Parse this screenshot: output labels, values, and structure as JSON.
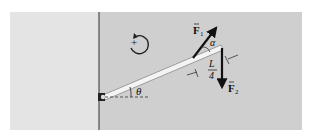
{
  "diagram": {
    "type": "physics-free-body",
    "colors": {
      "frame": "#ffffff",
      "wall_region": "#e4e4e4",
      "space_region": "#cfcfcf",
      "rod_fill": "#f4f4f4",
      "rod_edge": "#8a8a8a",
      "force_arrow": "#111111",
      "wall_line": "#333333"
    },
    "labels": {
      "force_1": "F",
      "force_1_sub": "1",
      "force_2": "F",
      "force_2_sub": "2",
      "angle_alpha": "α",
      "angle_theta": "θ",
      "length_numerator": "L",
      "length_denominator": "4",
      "rotation_sign": "+"
    },
    "geometry": {
      "pivot": [
        103,
        97
      ],
      "rod_end": [
        222,
        47
      ],
      "f1_tail": [
        193,
        58
      ],
      "f1_head": [
        217,
        27
      ],
      "f2_tail": [
        222,
        47
      ],
      "f2_head": [
        222,
        88
      ]
    }
  }
}
